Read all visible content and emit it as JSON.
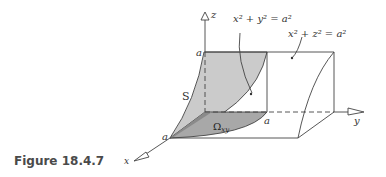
{
  "figure": {
    "caption": "Figure 18.4.7",
    "labels": {
      "z_axis": "z",
      "y_axis": "y",
      "x_axis": "x",
      "a_top": "a",
      "a_y": "a",
      "a_x": "a",
      "surface": "S",
      "region_main": "Ω",
      "region_sub": "xy",
      "cylinder1_lhs": "x",
      "cylinder1_eq": "x² + y² = a²",
      "cylinder2_eq": "x² + z² = a²"
    },
    "colors": {
      "surface_fill": "#c8c8c8",
      "region_fill": "#a9a9a9",
      "line": "#444444",
      "background": "#ffffff"
    }
  }
}
